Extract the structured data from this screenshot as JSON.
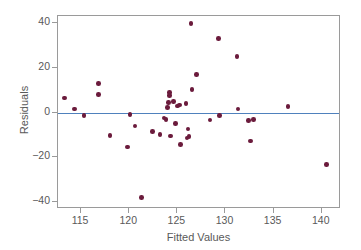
{
  "chart_data": {
    "type": "scatter",
    "title": "",
    "xlabel": "Fitted Values",
    "ylabel": "Residuals",
    "xlim": [
      112.6,
      142.0
    ],
    "ylim": [
      -43.2,
      43.2
    ],
    "xticks": [
      115,
      120,
      125,
      130,
      135,
      140
    ],
    "yticks": [
      40,
      20,
      0,
      -20,
      -40
    ],
    "xtick_labels": [
      "115",
      "120",
      "125",
      "130",
      "135",
      "140"
    ],
    "ytick_labels": [
      "40",
      "20",
      "0",
      "−20",
      "−40"
    ],
    "grid": false,
    "legend": null,
    "reference_lines": [
      {
        "name": "zero-residual-line",
        "orientation": "horizontal",
        "y": 0,
        "color": "#4f81bd"
      }
    ],
    "marker_color": "#6b1b3c",
    "points": [
      {
        "x": 113.3,
        "y": 6.5
      },
      {
        "x": 114.3,
        "y": 1.5
      },
      {
        "x": 115.3,
        "y": -1.3
      },
      {
        "x": 116.8,
        "y": 13.0
      },
      {
        "x": 116.8,
        "y": 8.0
      },
      {
        "x": 118.0,
        "y": -10.2
      },
      {
        "x": 119.8,
        "y": -15.5
      },
      {
        "x": 120.1,
        "y": -1.0
      },
      {
        "x": 120.6,
        "y": -6.0
      },
      {
        "x": 121.3,
        "y": -38.0
      },
      {
        "x": 122.4,
        "y": -8.5
      },
      {
        "x": 123.2,
        "y": -9.8
      },
      {
        "x": 123.6,
        "y": -2.5
      },
      {
        "x": 123.8,
        "y": -3.2
      },
      {
        "x": 124.0,
        "y": 2.3
      },
      {
        "x": 124.1,
        "y": 4.6
      },
      {
        "x": 124.2,
        "y": 9.0
      },
      {
        "x": 124.2,
        "y": 7.5
      },
      {
        "x": 124.3,
        "y": -10.5
      },
      {
        "x": 124.6,
        "y": 5.0
      },
      {
        "x": 124.8,
        "y": -4.8
      },
      {
        "x": 125.0,
        "y": 3.0
      },
      {
        "x": 125.2,
        "y": 3.4
      },
      {
        "x": 125.3,
        "y": -14.2
      },
      {
        "x": 125.9,
        "y": 4.0
      },
      {
        "x": 126.0,
        "y": -11.5
      },
      {
        "x": 126.1,
        "y": -7.3
      },
      {
        "x": 126.2,
        "y": -10.7
      },
      {
        "x": 126.4,
        "y": 39.8
      },
      {
        "x": 126.5,
        "y": 10.2
      },
      {
        "x": 127.0,
        "y": 17.0
      },
      {
        "x": 128.4,
        "y": -3.4
      },
      {
        "x": 129.3,
        "y": 33.0
      },
      {
        "x": 129.4,
        "y": -1.3
      },
      {
        "x": 131.2,
        "y": 25.0
      },
      {
        "x": 131.3,
        "y": 1.6
      },
      {
        "x": 132.4,
        "y": -3.6
      },
      {
        "x": 132.6,
        "y": -12.7
      },
      {
        "x": 132.9,
        "y": -3.2
      },
      {
        "x": 136.5,
        "y": 2.6
      },
      {
        "x": 140.5,
        "y": -23.2
      }
    ]
  },
  "plot": {
    "frame_color": "#9a9a9a",
    "background": "#ffffff"
  }
}
